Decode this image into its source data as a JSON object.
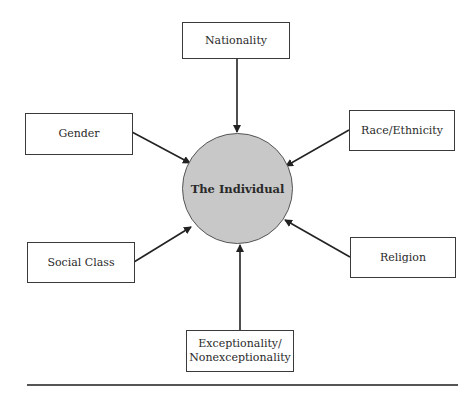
{
  "diagram": {
    "center": {
      "label": "The Individual",
      "fill": "#c8c8c8"
    },
    "factors": [
      {
        "id": "nationality",
        "label": "Nationality"
      },
      {
        "id": "gender",
        "label": "Gender"
      },
      {
        "id": "race-ethnicity",
        "label": "Race/Ethnicity"
      },
      {
        "id": "social-class",
        "label": "Social Class"
      },
      {
        "id": "religion",
        "label": "Religion"
      },
      {
        "id": "exceptionality",
        "label_line1": "Exceptionality/",
        "label_line2": "Nonexceptionality"
      }
    ],
    "edge_style": "arrow pointing from each factor box to the central circle"
  }
}
